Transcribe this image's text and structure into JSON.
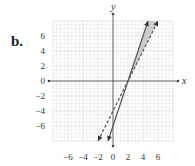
{
  "part_label": "b.",
  "chart_data": {
    "type": "line",
    "title": "",
    "xlabel": "x",
    "ylabel": "y",
    "xlim": [
      -8,
      8
    ],
    "ylim": [
      -8,
      8
    ],
    "grid": true,
    "x_ticks": [
      "−6",
      "−4",
      "−2",
      "0",
      "2",
      "4",
      "6"
    ],
    "y_ticks": [
      "6",
      "4",
      "2",
      "0",
      "−2",
      "−4",
      "−6"
    ],
    "series": [
      {
        "name": "boundary solid",
        "equation": "y = 3x − 6",
        "style": "solid",
        "points": [
          [
            -0.67,
            -8
          ],
          [
            4.67,
            8
          ]
        ]
      },
      {
        "name": "boundary dashed",
        "equation": "y = 2x − 4",
        "style": "dashed",
        "points": [
          [
            -2,
            -8
          ],
          [
            6,
            8
          ]
        ]
      }
    ],
    "shaded_region": {
      "description": "wedge between the two lines above their intersection (2, 0)",
      "vertices": [
        [
          2,
          0
        ],
        [
          4.67,
          8
        ],
        [
          6,
          8
        ]
      ],
      "color": "#c8c8c8"
    },
    "intersection": [
      2,
      0
    ]
  },
  "colors": {
    "grid_minor": "#e4e4e4",
    "grid_major": "#cfcfcf",
    "axis": "#444444",
    "line": "#555555",
    "shade": "#c8c8c8"
  }
}
